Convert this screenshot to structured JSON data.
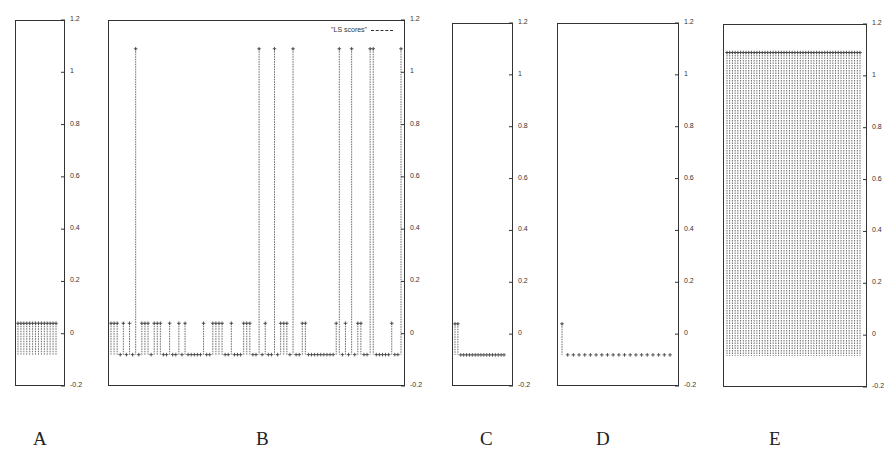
{
  "chart_data": [
    {
      "type": "stem",
      "panel": "A",
      "title": "",
      "xlabel": "A",
      "ylabel": "",
      "ylim": [
        -0.2,
        1.2
      ],
      "yticks": [
        -0.2,
        0,
        0.2,
        0.4,
        0.6,
        0.8,
        1,
        1.2
      ],
      "grid": false,
      "baseline": -0.08,
      "values": [
        0.04,
        0.04,
        0.04,
        0.04,
        0.04,
        0.04,
        0.04,
        0.04,
        0.04,
        0.04,
        0.04,
        0.04,
        0.04,
        0.04
      ]
    },
    {
      "type": "stem",
      "panel": "B",
      "title": "",
      "xlabel": "B",
      "ylabel": "",
      "ylim": [
        -0.2,
        1.2
      ],
      "yticks": [
        -0.2,
        0,
        0.2,
        0.4,
        0.6,
        0.8,
        1,
        1.2
      ],
      "grid": false,
      "legend": {
        "entries": [
          "\"LS scores\""
        ],
        "position": "top-right"
      },
      "baseline": -0.08,
      "values": [
        0.04,
        0.04,
        0.04,
        -0.08,
        0.04,
        -0.08,
        0.04,
        -0.08,
        1.09,
        -0.08,
        0.04,
        0.04,
        0.04,
        -0.08,
        0.04,
        0.04,
        0.04,
        -0.08,
        -0.08,
        0.04,
        -0.08,
        -0.08,
        0.04,
        -0.08,
        0.04,
        -0.08,
        -0.08,
        -0.08,
        -0.08,
        -0.08,
        0.04,
        -0.08,
        -0.08,
        0.04,
        0.04,
        0.04,
        0.04,
        -0.08,
        -0.08,
        0.04,
        -0.08,
        -0.08,
        -0.08,
        0.04,
        0.04,
        0.04,
        -0.08,
        -0.08,
        1.09,
        -0.08,
        0.04,
        -0.08,
        -0.08,
        1.09,
        -0.08,
        0.04,
        0.04,
        0.04,
        -0.08,
        1.09,
        -0.08,
        -0.08,
        0.04,
        0.04,
        -0.08,
        -0.08,
        -0.08,
        -0.08,
        -0.08,
        -0.08,
        -0.08,
        -0.08,
        -0.08,
        0.04,
        1.09,
        -0.08,
        0.04,
        -0.08,
        1.09,
        -0.08,
        0.04,
        0.04,
        -0.08,
        -0.08,
        1.09,
        1.09,
        -0.08,
        -0.08,
        -0.08,
        -0.08,
        -0.08,
        0.04,
        -0.08,
        -0.08,
        1.09
      ]
    },
    {
      "type": "stem",
      "panel": "C",
      "title": "",
      "xlabel": "C",
      "ylabel": "",
      "ylim": [
        -0.2,
        1.2
      ],
      "yticks": [
        -0.2,
        0,
        0.2,
        0.4,
        0.6,
        0.8,
        1,
        1.2
      ],
      "grid": false,
      "baseline": -0.08,
      "values": [
        0.04,
        0.04,
        -0.08,
        -0.08,
        -0.08,
        -0.08,
        -0.08,
        -0.08,
        -0.08,
        -0.08,
        -0.08,
        -0.08,
        -0.08,
        -0.08,
        -0.08,
        -0.08,
        -0.08,
        -0.08
      ]
    },
    {
      "type": "stem",
      "panel": "D",
      "title": "",
      "xlabel": "D",
      "ylabel": "",
      "ylim": [
        -0.2,
        1.2
      ],
      "yticks": [
        -0.2,
        0,
        0.2,
        0.4,
        0.6,
        0.8,
        1,
        1.2
      ],
      "grid": false,
      "baseline": -0.08,
      "values": [
        0.04,
        -0.08,
        -0.08,
        -0.08,
        -0.08,
        -0.08,
        -0.08,
        -0.08,
        -0.08,
        -0.08,
        -0.08,
        -0.08,
        -0.08,
        -0.08,
        -0.08,
        -0.08,
        -0.08,
        -0.08,
        -0.08,
        -0.08
      ]
    },
    {
      "type": "stem",
      "panel": "E",
      "title": "",
      "xlabel": "E",
      "ylabel": "",
      "ylim": [
        -0.2,
        1.2
      ],
      "yticks": [
        -0.2,
        0,
        0.2,
        0.4,
        0.6,
        0.8,
        1,
        1.2
      ],
      "grid": false,
      "baseline": -0.08,
      "values": [
        1.09,
        1.09,
        1.09,
        1.09,
        1.09,
        1.09,
        1.09,
        1.09,
        1.09,
        1.09,
        1.09,
        1.09,
        1.09,
        1.09,
        1.09,
        1.09,
        1.09,
        1.09,
        1.09,
        1.09,
        1.09,
        1.09,
        1.09,
        1.09,
        1.09,
        1.09,
        1.09,
        1.09,
        1.09,
        1.09,
        1.09,
        1.09,
        1.09,
        1.09,
        1.09,
        1.09,
        1.09,
        1.09,
        1.09,
        1.09,
        1.09,
        1.09,
        1.09,
        1.09,
        1.09,
        1.09,
        1.09,
        1.09,
        1.09,
        1.09
      ]
    }
  ],
  "panels": [
    {
      "label": "A",
      "frame": {
        "x": 15,
        "y": 20,
        "w": 50,
        "h": 366
      },
      "data_x": [
        18,
        56
      ],
      "label_x": 40
    },
    {
      "label": "B",
      "frame": {
        "x": 108,
        "y": 20,
        "w": 297,
        "h": 366
      },
      "data_x": [
        111,
        401
      ],
      "label_x": 263
    },
    {
      "label": "C",
      "frame": {
        "x": 452,
        "y": 23,
        "w": 61,
        "h": 363
      },
      "data_x": [
        455,
        504
      ],
      "label_x": 487
    },
    {
      "label": "D",
      "frame": {
        "x": 557,
        "y": 23,
        "w": 122,
        "h": 363
      },
      "data_x": [
        562,
        670
      ],
      "label_x": 603
    },
    {
      "label": "E",
      "frame": {
        "x": 723,
        "y": 24,
        "w": 144,
        "h": 363
      },
      "data_x": [
        727,
        860
      ],
      "label_x": 776
    }
  ],
  "legend_text": "\"LS scores\"",
  "tick_labels": [
    "1.2",
    "1",
    "0.8",
    "0.6",
    "0.4",
    "0.2",
    "0",
    "-0.2"
  ],
  "colors": {
    "stem": "#444444",
    "frame": "#333333",
    "text": "#333333"
  }
}
